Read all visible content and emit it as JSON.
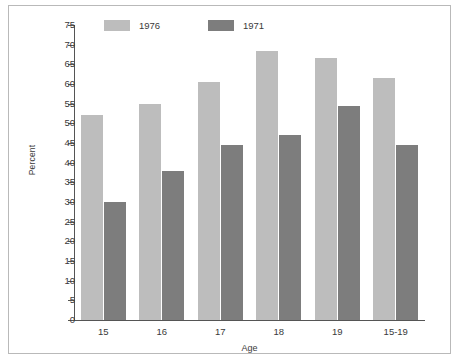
{
  "chart_data": {
    "type": "bar",
    "title": "",
    "xlabel": "Age",
    "ylabel": "Percent",
    "categories": [
      "15",
      "16",
      "17",
      "18",
      "19",
      "15-19"
    ],
    "series": [
      {
        "name": "1976",
        "color": "#bdbdbd",
        "values": [
          52,
          55,
          60.5,
          68.5,
          66.5,
          61.5
        ]
      },
      {
        "name": "1971",
        "color": "#7d7d7d",
        "values": [
          30,
          38,
          44.5,
          47,
          54.5,
          44.5
        ]
      }
    ],
    "ylim": [
      0,
      75
    ],
    "ytick_step": 5,
    "yticks": [
      "75",
      "70",
      "65",
      "60",
      "55",
      "50",
      "45",
      "40",
      "35",
      "30",
      "25",
      "20",
      "15",
      "10",
      "5",
      "0"
    ],
    "grid": false,
    "legend_position": "top-left"
  },
  "figure": {
    "border_color": "#b9b9b9",
    "axis_color": "#555555",
    "background": "#ffffff"
  }
}
